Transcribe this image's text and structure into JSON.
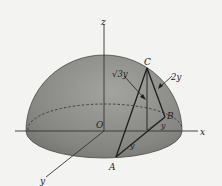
{
  "figure": {
    "colors": {
      "background": "#f3f3f1",
      "hemisphere_fill": "#8a8a88",
      "hemisphere_edge": "#4a4a4a",
      "line": "#1e1e1e"
    },
    "axes": {
      "x_label": "x",
      "y_label": "y",
      "z_label": "z",
      "origin_label": "O"
    },
    "points": {
      "A": "A",
      "B": "B",
      "C": "C"
    },
    "dimensions": {
      "vertical_height": "√3y",
      "slant_edge": "2y",
      "ab_length": "y",
      "b_offset": "y"
    }
  }
}
